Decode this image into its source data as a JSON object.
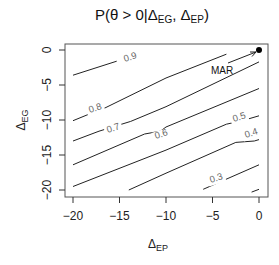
{
  "chart_data": {
    "type": "contour",
    "title_parts": {
      "main": "P(θ > 0|Δ",
      "sub1": "EG",
      "sep": ", Δ",
      "sub2": "EP",
      "close": ")"
    },
    "xlabel": "Δ_EP",
    "xlabel_parts": {
      "main": "Δ",
      "sub": "EP"
    },
    "ylabel": "Δ_EG",
    "ylabel_parts": {
      "main": "Δ",
      "sub": "EG"
    },
    "xlim": [
      -21,
      0.8
    ],
    "ylim": [
      -21,
      0.8
    ],
    "x_ticks": [
      -20,
      -15,
      -10,
      -5,
      0
    ],
    "y_ticks": [
      -20,
      -15,
      -10,
      -5,
      0
    ],
    "x_tick_labels": [
      "−20",
      "−15",
      "−10",
      "−5",
      "0"
    ],
    "y_tick_labels": [
      "−20",
      "−15",
      "−10",
      "−5",
      "0"
    ],
    "grid": false,
    "contour_levels": [
      0.9,
      0.8,
      0.7,
      0.6,
      0.5,
      0.4,
      0.3
    ],
    "contour_labels": [
      "0.9",
      "0.8",
      "0.7",
      "0.6",
      "0.5",
      "0.4",
      "0.3"
    ],
    "contours": [
      {
        "level": 0.9,
        "points": [
          [
            -20,
            -3.6
          ],
          [
            -15.3,
            -1.6
          ]
        ]
      },
      {
        "level": 0.8,
        "points": [
          [
            -20,
            -10.1
          ],
          [
            -17.8,
            -8.9
          ],
          [
            -16.9,
            -8.5
          ],
          [
            -10,
            -4.0
          ],
          [
            -3.5,
            -0.6
          ]
        ]
      },
      {
        "level": 0.7,
        "points": [
          [
            -20,
            -13.0
          ],
          [
            -17.2,
            -11.6
          ],
          [
            -13.8,
            -10.2
          ],
          [
            -10,
            -8.1
          ],
          [
            0,
            -1.7
          ]
        ]
      },
      {
        "level": 0.6,
        "points": [
          [
            -20,
            -16.4
          ],
          [
            -12.3,
            -12.0
          ],
          [
            -10.6,
            -11.6
          ],
          [
            -10,
            -11.0
          ],
          [
            0,
            -5.5
          ]
        ]
      },
      {
        "level": 0.5,
        "points": [
          [
            -20,
            -19.5
          ],
          [
            -10,
            -14.3
          ],
          [
            -3.5,
            -10.6
          ],
          [
            -1.8,
            -10.1
          ],
          [
            0,
            -9.4
          ]
        ]
      },
      {
        "level": 0.4,
        "points": [
          [
            -14.0,
            -20.0
          ],
          [
            -10,
            -17.6
          ],
          [
            -2.5,
            -13.2
          ],
          [
            -0.5,
            -13.0
          ],
          [
            0,
            -12.8
          ]
        ]
      },
      {
        "level": 0.3,
        "points": [
          [
            -6.0,
            -19.9
          ],
          [
            0,
            -16.4
          ]
        ]
      },
      {
        "level": 0.2,
        "points": [
          [
            -0.8,
            -20.3
          ],
          [
            0,
            -19.9
          ]
        ]
      }
    ],
    "points": [
      {
        "label": "MAR",
        "x": 0,
        "y": 0
      }
    ],
    "annotations": [
      {
        "text": "MAR",
        "arrow_from": [
          -3.3,
          -2.0
        ],
        "arrow_to": [
          -0.3,
          -0.3
        ]
      }
    ]
  }
}
